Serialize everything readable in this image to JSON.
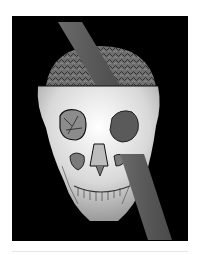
{
  "image": {
    "description": "3D CT reconstruction of a skull with an iron rod passing diagonally through the left orbit and skull top",
    "colors": {
      "background": "#000000",
      "page": "#ffffff",
      "bone": "#e8e8e8",
      "rod": "#5e5e5e",
      "brain": "#8a8a8a"
    }
  }
}
